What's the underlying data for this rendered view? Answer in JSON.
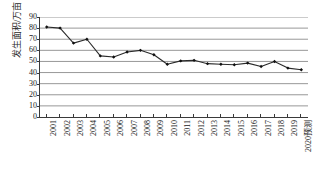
{
  "figure": {
    "top_fragment": "",
    "colors": {
      "line": "#2b2b2b",
      "marker": "#111111",
      "gridline": "#8c8c8c",
      "axis": "#3a3a3a",
      "background": "#ffffff"
    }
  },
  "chart_data": {
    "type": "line",
    "title": "",
    "xlabel": "",
    "ylabel": "发生面积/万亩",
    "ylim": [
      0,
      90
    ],
    "ytick_step": 10,
    "yticks": [
      0,
      10,
      20,
      30,
      40,
      50,
      60,
      70,
      80,
      90
    ],
    "grid": true,
    "grid_axis": "y",
    "legend": false,
    "legend_position": "none",
    "marker": "filled-diamond",
    "categories": [
      "2001",
      "2002",
      "2003",
      "2004",
      "2005",
      "2006",
      "2007",
      "2008",
      "2009",
      "2010",
      "2011",
      "2012",
      "2013",
      "2014",
      "2015",
      "2016",
      "2017",
      "2018",
      "2019",
      "2020预测"
    ],
    "values": [
      81,
      80,
      66.5,
      70,
      55,
      54,
      58.5,
      60,
      56,
      47.5,
      50.5,
      51,
      48,
      47.5,
      47,
      48.5,
      45.5,
      50,
      44,
      42.5
    ],
    "series": [
      {
        "name": "发生面积",
        "values": [
          81,
          80,
          66.5,
          70,
          55,
          54,
          58.5,
          60,
          56,
          47.5,
          50.5,
          51,
          48,
          47.5,
          47,
          48.5,
          45.5,
          50,
          44,
          42.5
        ]
      }
    ]
  }
}
